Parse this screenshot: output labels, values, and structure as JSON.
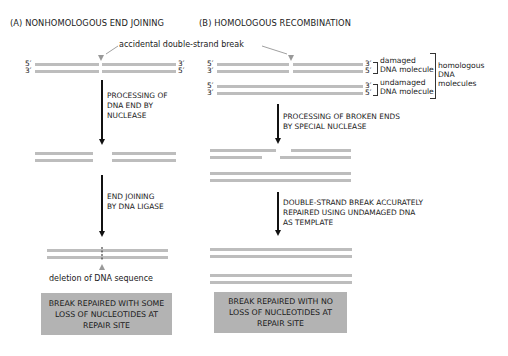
{
  "panels": {
    "a": {
      "title": "(A)  NONHOMOLOGOUS END JOINING",
      "strand_ends": {
        "top_left": "5′",
        "bottom_left": "3′",
        "top_right": "3′",
        "bottom_right": "5′"
      },
      "step1": [
        "PROCESSING OF",
        "DNA END BY",
        "NUCLEASE"
      ],
      "step2": [
        "END JOINING",
        "BY DNA LIGASE"
      ],
      "deletion_label": "deletion of DNA sequence",
      "result": [
        "BREAK REPAIRED WITH SOME",
        "LOSS OF NUCLEOTIDES AT",
        "REPAIR SITE"
      ]
    },
    "b": {
      "title": "(B)  HOMOLOGOUS RECOMBINATION",
      "damaged_ends": {
        "top_left": "5′",
        "bottom_left": "3′",
        "top_right": "3′",
        "bottom_right": "5′"
      },
      "undamaged_ends": {
        "top_left": "5′",
        "bottom_left": "3′",
        "top_right": "3′",
        "bottom_right": "5′"
      },
      "damaged_label": [
        "damaged",
        "DNA molecule"
      ],
      "undamaged_label": [
        "undamaged",
        "DNA molecule"
      ],
      "homologous_label": [
        "homologous",
        "DNA",
        "molecules"
      ],
      "step1": [
        "PROCESSING OF BROKEN ENDS",
        "BY SPECIAL NUCLEASE"
      ],
      "step2": [
        "DOUBLE-STRAND BREAK ACCURATELY",
        "REPAIRED USING UNDAMAGED DNA",
        "AS TEMPLATE"
      ],
      "result": [
        "BREAK REPAIRED WITH NO",
        "LOSS OF NUCLEOTIDES AT",
        "REPAIR SITE"
      ]
    }
  },
  "break_label": "accidental double-strand break",
  "colors": {
    "strand": "#bdbdbd",
    "result_box": "#b3b3b3",
    "arrow": "#111111"
  }
}
